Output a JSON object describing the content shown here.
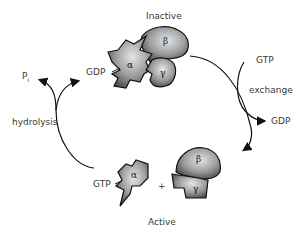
{
  "diagram": {
    "title_top": "Inactive",
    "title_bottom": "Active",
    "labels": {
      "gdp_top_left": "GDP",
      "gtp_right": "GTP",
      "exchange": "exchange",
      "gdp_right": "GDP",
      "pi_base": "P",
      "pi_sub": "i",
      "hydrolysis": "hydrolysis",
      "gtp_bottom": "GTP",
      "plus": "+"
    },
    "subunits": {
      "alpha": "α",
      "beta": "β",
      "gamma": "γ"
    },
    "colors": {
      "protein_dark": "#3c3c3c",
      "protein_light": "#d9d9d9",
      "stroke": "#111111",
      "text": "#3a3a3a"
    }
  }
}
